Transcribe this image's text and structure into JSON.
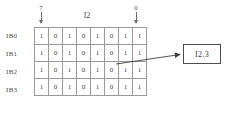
{
  "diagram": {
    "byte_label": "I2",
    "column_markers": {
      "leftmost_bit": "7",
      "rightmost_bit": "0"
    },
    "row_labels": [
      "IB0",
      "IB1",
      "IB2",
      "IB3"
    ],
    "rows": [
      {
        "label": "IB0",
        "bits": [
          "1",
          "0",
          "1",
          "0",
          "1",
          "0",
          "1",
          "1"
        ]
      },
      {
        "label": "IB1",
        "bits": [
          "1",
          "0",
          "1",
          "0",
          "1",
          "0",
          "1",
          "1"
        ]
      },
      {
        "label": "IB2",
        "bits": [
          "1",
          "0",
          "1",
          "0",
          "1",
          "0",
          "1",
          "1"
        ]
      },
      {
        "label": "IB3",
        "bits": [
          "1",
          "0",
          "1",
          "0",
          "1",
          "0",
          "1",
          "1"
        ]
      }
    ],
    "callout": {
      "text": "I2.3"
    },
    "icons": {
      "marker_arrow": "arrow-down-icon",
      "connector": "arrow-right-icon"
    },
    "colors": {
      "background": "#ffffff",
      "cell_border": "#9a9a9a",
      "text": "#3a3a3a",
      "callout_border": "#4d4d4d",
      "connector": "#3d3d3d"
    }
  }
}
